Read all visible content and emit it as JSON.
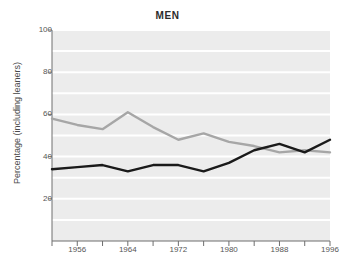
{
  "chart_data": {
    "type": "line",
    "title": "MEN",
    "xlabel": "",
    "ylabel": "Percentage (including leaners)",
    "xlim": [
      1952,
      1996
    ],
    "ylim": [
      0,
      100
    ],
    "grid": true,
    "grid_orientation": "horizontal",
    "legend": "none",
    "x": [
      1952,
      1956,
      1960,
      1964,
      1968,
      1972,
      1976,
      1980,
      1984,
      1988,
      1992,
      1996
    ],
    "series": [
      {
        "name": "gray-series",
        "color": "#a6a6a6",
        "values": [
          58,
          55,
          53,
          61,
          54,
          48,
          51,
          47,
          45,
          42,
          43,
          42
        ]
      },
      {
        "name": "black-series",
        "color": "#1a1a1a",
        "values": [
          34,
          35,
          36,
          33,
          36,
          36,
          33,
          37,
          43,
          46,
          42,
          48
        ]
      }
    ],
    "yticks": [
      20,
      40,
      60,
      80,
      100
    ],
    "ytick_labels": [
      "20",
      "40",
      "60",
      "80",
      "100"
    ],
    "xticks": [
      1956,
      1964,
      1972,
      1980,
      1988,
      1996
    ],
    "xtick_labels": [
      "1956",
      "1964",
      "1972",
      "1980",
      "1988",
      "1996"
    ],
    "xminor_ticks": [
      1952,
      1960,
      1968,
      1976,
      1984,
      1992
    ],
    "plot_background": "#ececec",
    "gridline_color": "#ffffff",
    "axis_color": "#6e6e6e",
    "figure_background": "#ffffff"
  }
}
